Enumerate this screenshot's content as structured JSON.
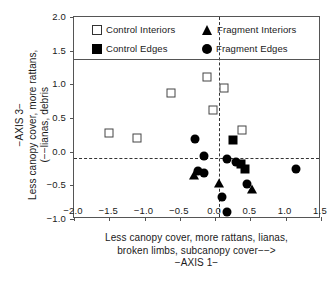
{
  "chart_data": {
    "type": "scatter",
    "title": "",
    "xlabel": "Less canopy cover, more rattans, lianas, broken limbs, subcanopy cover−−>",
    "xlabel_lines": [
      "Less canopy cover, more rattans, lianas,",
      "broken limbs, subcanopy cover−−>",
      "−AXIS 1−"
    ],
    "ylabel": "Less canopy cover, more rattans, (−−lianas, debris",
    "ylabel_lines": [
      "−AXIS 3−",
      "Less canopy cover, more rattans,",
      "(−−lianas, debris"
    ],
    "xlim": [
      -2.0,
      1.5
    ],
    "ylim": [
      -1.0,
      2.0
    ],
    "xticks": [
      -2.0,
      -1.5,
      -1.0,
      -0.5,
      0.0,
      0.5,
      1.0,
      1.5
    ],
    "xticklabels": [
      "−2.0",
      "−1.5",
      "−1.0",
      "−0.5",
      "0.0",
      "0.5",
      "1.0",
      "1.5"
    ],
    "yticks": [
      -1.0,
      -0.5,
      0.0,
      0.5,
      1.0,
      1.5,
      2.0
    ],
    "yticklabels": [
      "−1.0",
      "−0.5",
      "0.0",
      "0.5",
      "1.0",
      "1.5",
      "2.0"
    ],
    "grid": false,
    "legend_position": "top-inside",
    "reference_lines": [
      {
        "orientation": "horizontal",
        "value": -0.09,
        "style": "dashed"
      },
      {
        "orientation": "vertical",
        "value": 0.05,
        "style": "dashed"
      },
      {
        "orientation": "horizontal",
        "value": 1.37,
        "style": "solid"
      }
    ],
    "series": [
      {
        "name": "Control Interiors",
        "marker": "square-open",
        "color": "#ffffff",
        "edge_color": "#444444",
        "points": [
          {
            "x": -1.5,
            "y": 0.27
          },
          {
            "x": -1.11,
            "y": 0.21
          },
          {
            "x": -0.62,
            "y": 0.87
          },
          {
            "x": -0.11,
            "y": 1.11
          },
          {
            "x": 0.12,
            "y": 0.94
          },
          {
            "x": -0.03,
            "y": 0.62
          },
          {
            "x": 0.38,
            "y": 0.32
          }
        ]
      },
      {
        "name": "Control Edges",
        "marker": "square-filled",
        "color": "#000000",
        "points": [
          {
            "x": 0.25,
            "y": 0.17
          },
          {
            "x": 0.37,
            "y": -0.18
          },
          {
            "x": 0.43,
            "y": -0.25
          }
        ]
      },
      {
        "name": "Fragment Interiors",
        "marker": "triangle-filled",
        "color": "#000000",
        "points": [
          {
            "x": -0.3,
            "y": -0.34
          },
          {
            "x": 0.06,
            "y": -0.46
          },
          {
            "x": 0.52,
            "y": -0.55
          }
        ]
      },
      {
        "name": "Fragment Edges",
        "marker": "circle-filled",
        "color": "#000000",
        "points": [
          {
            "x": -0.29,
            "y": 0.19
          },
          {
            "x": -0.16,
            "y": -0.06
          },
          {
            "x": -0.25,
            "y": -0.29
          },
          {
            "x": -0.16,
            "y": -0.31
          },
          {
            "x": 0.17,
            "y": -0.11
          },
          {
            "x": 0.3,
            "y": -0.16
          },
          {
            "x": 0.45,
            "y": -0.48
          },
          {
            "x": 1.15,
            "y": -0.25
          },
          {
            "x": 0.1,
            "y": -0.67
          },
          {
            "x": 0.17,
            "y": -0.89
          }
        ]
      }
    ]
  }
}
